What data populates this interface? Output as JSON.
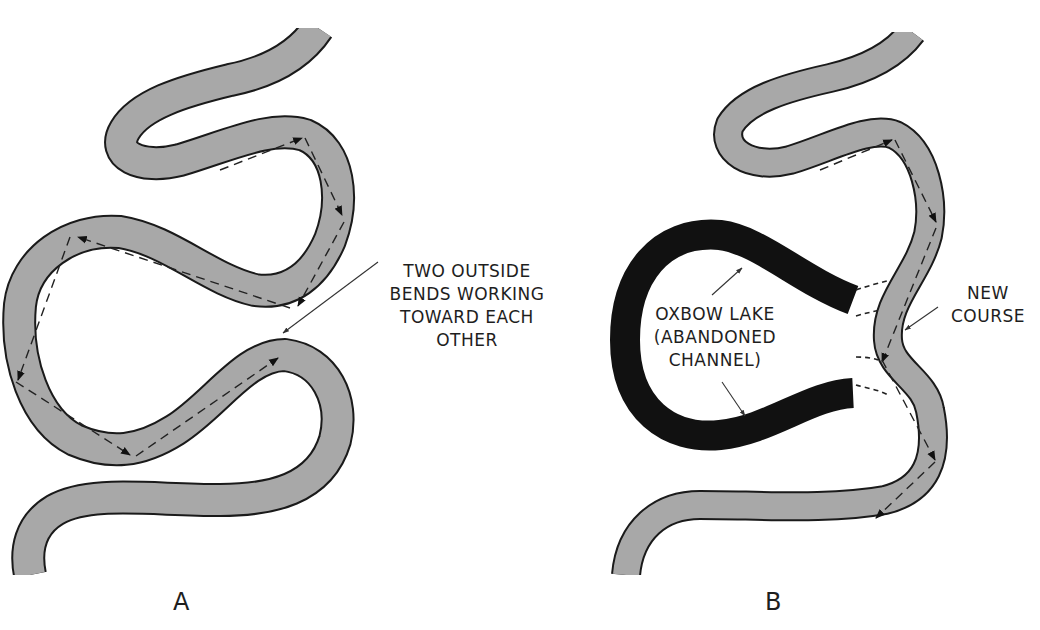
{
  "figure": {
    "panels": [
      {
        "id": "A",
        "letter": "A",
        "annotation": {
          "lines": [
            "TWO OUTSIDE",
            "BENDS WORKING",
            "TOWARD EACH",
            "OTHER"
          ]
        }
      },
      {
        "id": "B",
        "letter": "B",
        "annotations": {
          "oxbow": {
            "lines": [
              "OXBOW LAKE",
              "(ABANDONED",
              "CHANNEL)"
            ]
          },
          "new_course": {
            "lines": [
              "NEW",
              "COURSE"
            ]
          }
        }
      }
    ],
    "colors": {
      "river_fill": "#a8a8a8",
      "river_outline": "#1a1a1a",
      "oxbow_fill": "#111111",
      "background": "#ffffff",
      "text": "#1e1e1e"
    },
    "icons": {
      "flow_arrow": "dashed-arrow-icon",
      "leader_arrow": "leader-arrow-icon"
    }
  }
}
